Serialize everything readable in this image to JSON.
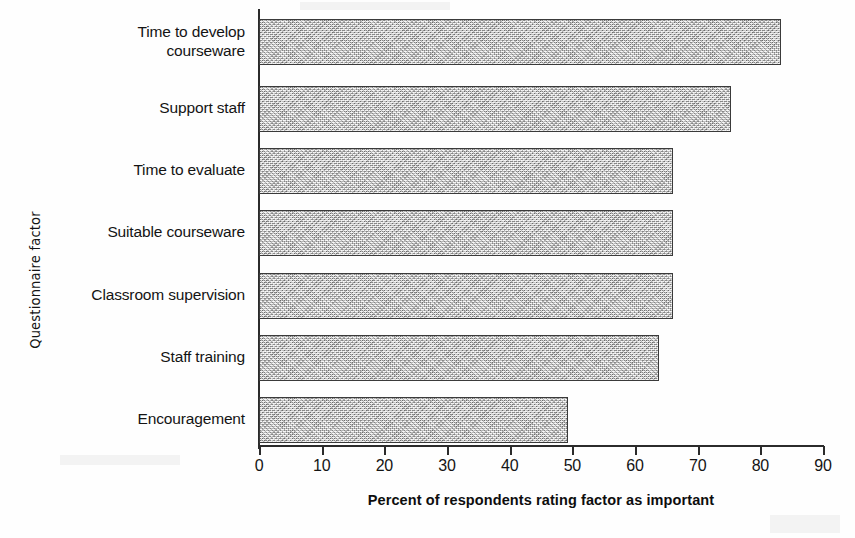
{
  "chart_data": {
    "type": "bar",
    "orientation": "horizontal",
    "title": "",
    "xlabel": "Percent of respondents rating factor as important",
    "ylabel": "Questionnaire factor",
    "categories": [
      "Time to develop\ncourseware",
      "Support staff",
      "Time to evaluate",
      "Suitable courseware",
      "Classroom supervision",
      "Staff training",
      "Encouragement"
    ],
    "values": [
      83.3,
      75.3,
      66,
      66,
      66,
      63.8,
      49.3
    ],
    "xlim": [
      0,
      90
    ],
    "xticks": [
      0,
      10,
      20,
      30,
      40,
      50,
      60,
      70,
      80,
      90
    ],
    "xtick_labels": [
      "0",
      "10",
      "20",
      "30",
      "40",
      "50",
      "60",
      "70",
      "80",
      "90"
    ],
    "grid": false,
    "legend": false,
    "bar_fill_color": "#b9b9b9",
    "bar_border_color": "#3a3a3a",
    "axis_color": "#2b2b2b"
  },
  "axis": {
    "x_title": "Percent of respondents rating factor as important",
    "y_title": "Questionnaire factor"
  }
}
